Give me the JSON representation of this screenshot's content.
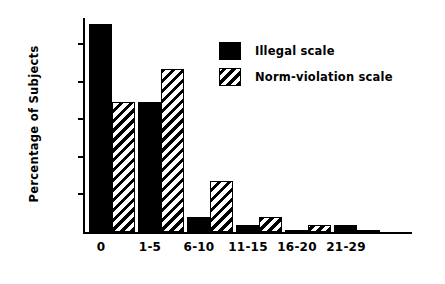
{
  "chart_data": {
    "type": "bar",
    "title": "",
    "xlabel": "",
    "ylabel": "Percentage of Subjects",
    "categories": [
      "0",
      "1-5",
      "6-10",
      "11-15",
      "16-20",
      "21-29"
    ],
    "series": [
      {
        "name": "Illegal scale",
        "values": [
          55.4,
          34.5,
          4.0,
          2.0,
          0.5,
          2.0
        ],
        "fill": "solid",
        "color": "#000000"
      },
      {
        "name": "Norm-violation scale",
        "values": [
          34.5,
          43.5,
          13.7,
          4.0,
          2.0,
          0.4
        ],
        "fill": "hatch",
        "color": "#000000"
      }
    ],
    "ylim": [
      0,
      57
    ],
    "yticks": [
      10,
      20,
      30,
      40,
      50
    ],
    "ytick_labels": [
      "10",
      "20",
      "30",
      "40",
      "50"
    ],
    "grid": false,
    "legend_position": "upper-right",
    "axis_color": "#000000",
    "background_color": "#ffffff"
  },
  "legend": {
    "items": [
      {
        "label": "Illegal scale",
        "swatch": "solid-square-swatch"
      },
      {
        "label": "Norm-violation scale",
        "swatch": "hatched-square-swatch"
      }
    ]
  }
}
